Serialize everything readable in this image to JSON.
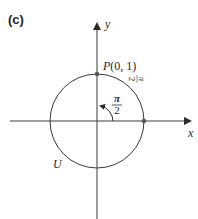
{
  "panel_label": "(c)",
  "axes": {
    "x_label": "x",
    "y_label": "y"
  },
  "point": {
    "label": "P(0, 1)"
  },
  "arc_length_label": {
    "num": "π",
    "den": "2"
  },
  "angle_label": {
    "num": "π",
    "den": "2"
  },
  "circle_label": "U",
  "colors": {
    "stroke": "#3a3a3a",
    "point": "#555555"
  }
}
